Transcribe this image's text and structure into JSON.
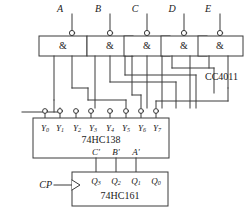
{
  "diagram": {
    "line_color": "#3a3a3a",
    "text_color": "#1a1a1a",
    "background": "#ffffff"
  },
  "inputs": [
    {
      "label": "A",
      "x": 62
    },
    {
      "label": "B",
      "x": 100
    },
    {
      "label": "C",
      "x": 137
    },
    {
      "label": "D",
      "x": 174
    },
    {
      "label": "E",
      "x": 210
    }
  ],
  "gates": {
    "symbol": "&",
    "family_label": "CC4011",
    "count": 5,
    "items": [
      {
        "name": "gate-a",
        "symbol": "&",
        "legs": 2
      },
      {
        "name": "gate-b",
        "symbol": "&",
        "legs": 3
      },
      {
        "name": "gate-c",
        "symbol": "&",
        "legs": 3
      },
      {
        "name": "gate-d",
        "symbol": "&",
        "legs": 2
      },
      {
        "name": "gate-e",
        "symbol": "&",
        "legs": 2
      }
    ]
  },
  "decoder": {
    "name": "74HC138",
    "outputs": [
      {
        "label": "Y",
        "sub": "0"
      },
      {
        "label": "Y",
        "sub": "1"
      },
      {
        "label": "Y",
        "sub": "2"
      },
      {
        "label": "Y",
        "sub": "3"
      },
      {
        "label": "Y",
        "sub": "4"
      },
      {
        "label": "Y",
        "sub": "5"
      },
      {
        "label": "Y",
        "sub": "6"
      },
      {
        "label": "Y",
        "sub": "7"
      }
    ],
    "address_inputs": [
      "C'",
      "B'",
      "A'"
    ]
  },
  "counter": {
    "name": "74HC161",
    "clock_label": "CP",
    "outputs": [
      {
        "label": "Q",
        "sub": "3"
      },
      {
        "label": "Q",
        "sub": "2"
      },
      {
        "label": "Q",
        "sub": "1"
      },
      {
        "label": "Q",
        "sub": "0"
      }
    ]
  }
}
